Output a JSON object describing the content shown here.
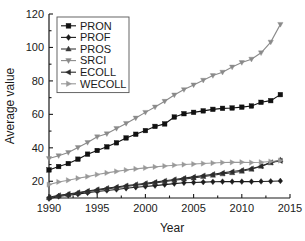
{
  "chart_data": {
    "type": "line",
    "title": "",
    "xlabel": "Year",
    "ylabel": "Average value",
    "xlim": [
      1990,
      2015
    ],
    "ylim": [
      10,
      120
    ],
    "xticks": [
      1990,
      1995,
      2000,
      2005,
      2010,
      2015
    ],
    "yticks": [
      20,
      40,
      60,
      80,
      100,
      120
    ],
    "grid": false,
    "legend_position": "upper-left",
    "x": [
      1990,
      1991,
      1992,
      1993,
      1994,
      1995,
      1996,
      1997,
      1998,
      1999,
      2000,
      2001,
      2002,
      2003,
      2004,
      2005,
      2006,
      2007,
      2008,
      2009,
      2010,
      2011,
      2012,
      2013,
      2014
    ],
    "series": [
      {
        "name": "PRON",
        "marker": "square",
        "color": "#111111",
        "values": [
          26.8,
          28.8,
          30.6,
          33.2,
          36.2,
          38.4,
          40.6,
          43.0,
          45.9,
          48.1,
          50.3,
          52.8,
          54.3,
          58.4,
          60.4,
          61.2,
          62.1,
          63.0,
          63.6,
          63.8,
          64.3,
          65.0,
          67.2,
          68.2,
          71.8
        ]
      },
      {
        "name": "PROF",
        "marker": "diamond",
        "color": "#1c1c1c",
        "values": [
          9.6,
          10.9,
          11.6,
          12.3,
          13.1,
          13.9,
          14.5,
          15.1,
          15.8,
          16.4,
          16.9,
          17.4,
          18.0,
          18.6,
          19.1,
          19.3,
          19.5,
          19.7,
          19.8,
          19.8,
          19.8,
          19.8,
          19.9,
          20.0,
          20.2
        ]
      },
      {
        "name": "PROS",
        "marker": "triangle-up",
        "color": "#3a3a3a",
        "values": [
          10.2,
          11.3,
          12.1,
          12.9,
          13.8,
          14.7,
          15.4,
          16.1,
          16.9,
          17.6,
          18.3,
          19.0,
          19.8,
          20.6,
          21.3,
          22.0,
          22.8,
          23.6,
          24.4,
          25.1,
          26.0,
          27.2,
          29.0,
          31.0,
          32.9
        ]
      },
      {
        "name": "SRCI",
        "marker": "triangle-down",
        "color": "#8a8a8a",
        "values": [
          33.6,
          35.3,
          37.2,
          40.2,
          43.2,
          46.6,
          48.4,
          51.6,
          54.6,
          57.8,
          61.2,
          64.4,
          67.8,
          71.6,
          74.8,
          77.6,
          80.4,
          83.2,
          85.2,
          88.3,
          91.0,
          93.0,
          96.8,
          103.2,
          113.8
        ]
      },
      {
        "name": "ECOLL",
        "marker": "triangle-left",
        "color": "#2b2b2b",
        "values": [
          10.4,
          11.6,
          12.4,
          13.3,
          14.2,
          15.1,
          15.9,
          16.6,
          17.4,
          18.1,
          18.8,
          19.5,
          20.3,
          21.1,
          21.9,
          22.6,
          23.4,
          24.2,
          25.0,
          25.8,
          26.6,
          27.6,
          29.0,
          31.3,
          32.2
        ]
      },
      {
        "name": "WECOLL",
        "marker": "triangle-right",
        "color": "#999999",
        "values": [
          18.0,
          19.6,
          20.6,
          21.8,
          22.8,
          24.0,
          25.0,
          25.9,
          26.7,
          27.4,
          28.0,
          28.6,
          29.1,
          29.6,
          30.0,
          30.3,
          30.6,
          30.9,
          31.2,
          31.3,
          31.4,
          31.2,
          31.4,
          31.8,
          32.4
        ]
      }
    ]
  },
  "legend": {
    "entries": [
      {
        "label": "PRON"
      },
      {
        "label": "PROF"
      },
      {
        "label": "PROS"
      },
      {
        "label": "SRCI"
      },
      {
        "label": "ECOLL"
      },
      {
        "label": "WECOLL"
      }
    ]
  },
  "axes": {
    "x_title": "Year",
    "y_title": "Average value",
    "x_tick_labels": [
      "1990",
      "1995",
      "2000",
      "2005",
      "2010",
      "2015"
    ],
    "y_tick_labels": [
      "20",
      "40",
      "60",
      "80",
      "100",
      "120"
    ]
  }
}
